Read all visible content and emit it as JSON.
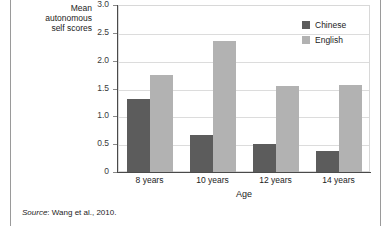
{
  "figure": {
    "source_note_lead": "Source",
    "source_note_text": ": Wang et al., 2010."
  },
  "legend": {
    "position": "top-right",
    "items": [
      {
        "label": "Chinese",
        "color": "#5c5c5c",
        "swatch_name": "legend-swatch-chinese"
      },
      {
        "label": "English",
        "color": "#b2b2b2",
        "swatch_name": "legend-swatch-english"
      }
    ]
  },
  "chart_data": {
    "type": "bar",
    "title": "",
    "subtitle": "",
    "xlabel": "Age",
    "ylabel": "Mean autonomous self scores",
    "ylabel_lines": [
      "Mean",
      "autonomous",
      "self scores"
    ],
    "categories": [
      "8 years",
      "10 years",
      "12 years",
      "14 years"
    ],
    "series": [
      {
        "name": "Chinese",
        "color": "#5c5c5c",
        "values": [
          1.31,
          0.67,
          0.5,
          0.38
        ]
      },
      {
        "name": "English",
        "color": "#b2b2b2",
        "values": [
          1.75,
          2.36,
          1.55,
          1.57
        ]
      }
    ],
    "ylim": [
      0,
      3.0
    ],
    "yticks": [
      0,
      0.5,
      1.0,
      1.5,
      2.0,
      2.5,
      3.0
    ],
    "ytick_labels": [
      "0",
      "0.5",
      "1.0",
      "1.5",
      "2.0",
      "2.5",
      "3.0"
    ],
    "grid": true,
    "grid_axis": "y",
    "legend_position": "top-right",
    "bar_group_gap": true,
    "background": "#ffffff"
  }
}
